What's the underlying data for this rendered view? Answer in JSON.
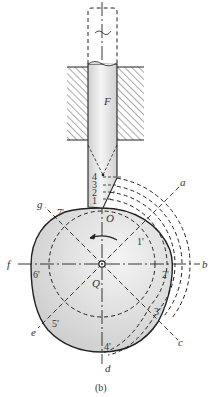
{
  "figure": {
    "caption": "(b)",
    "follower_label": "F",
    "contact_point_label": "O",
    "pivot_label": "Q",
    "rotation_direction": "counterclockwise"
  },
  "follower_positions": [
    "1",
    "2",
    "3",
    "4"
  ],
  "cam_points": [
    "1'",
    "2'",
    "3'",
    "4'",
    "5'",
    "6'",
    "7'"
  ],
  "radial_lines": [
    "a",
    "b",
    "c",
    "d",
    "e",
    "f",
    "g"
  ],
  "colors": {
    "line": "#222222",
    "cam_fill": "#d8d8d8",
    "cam_fill_highlight": "#f2f2f2",
    "rod_fill": "#e6e6e6",
    "hatch": "#555555"
  }
}
